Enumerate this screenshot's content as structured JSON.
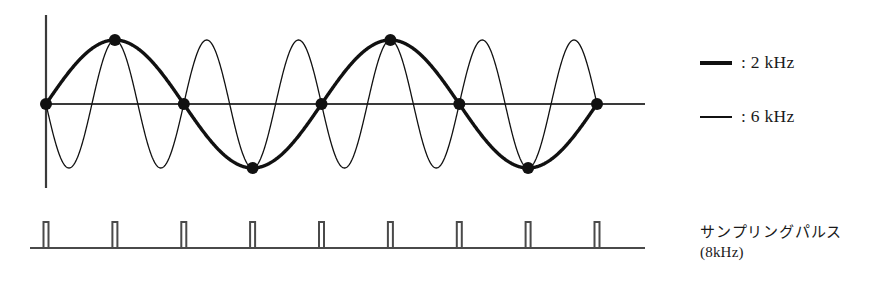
{
  "figure": {
    "title_hidden": "",
    "background_color": "#ffffff",
    "ink_color": "#111111"
  },
  "legend": {
    "position": "right",
    "entries": [
      {
        "swatch": "thick-line-swatch",
        "style": "thick",
        "label": ": 2 kHz",
        "frequency_khz": 2
      },
      {
        "swatch": "thin-line-swatch",
        "style": "thin",
        "label": ": 6 kHz",
        "frequency_khz": 6
      }
    ]
  },
  "caption": {
    "line1": "サンプリングパルス",
    "line2": "(8kHz)"
  },
  "chart_data": {
    "type": "line",
    "title": "",
    "xlabel": "",
    "ylabel": "",
    "grid": false,
    "legend_position": "right",
    "axes": {
      "x_axis_y_px": 104,
      "x_axis_from_px": 46,
      "x_axis_to_px": 645,
      "y_axis_x_px": 46,
      "y_axis_from_px": 15,
      "y_axis_to_px": 188,
      "amplitude_px": 64,
      "x_range_periods": 4,
      "xlim": [
        0,
        4
      ],
      "ylim": [
        -1,
        1
      ]
    },
    "series": [
      {
        "name": "2 kHz",
        "style": "thick",
        "stroke_width": 3.4,
        "color": "#111111",
        "waveform": "sin",
        "cycles_across_plot": 2,
        "phase_deg": 0,
        "amplitude": 1,
        "description": "Thick 2 kHz sine: two full cycles across the plot"
      },
      {
        "name": "6 kHz",
        "style": "thin",
        "stroke_width": 1.3,
        "color": "#111111",
        "waveform": "-sin",
        "cycles_across_plot": 6,
        "phase_deg": 180,
        "amplitude": 1,
        "description": "Thin 6 kHz sine (inverted), six full cycles; aliases onto the 2 kHz samples"
      }
    ],
    "sample_points": {
      "name": "sample dots",
      "count": 9,
      "rate_khz": 8,
      "marker": "filled-circle",
      "radius_px": 6,
      "x_px": [
        46,
        114.9,
        183.8,
        252.6,
        321.5,
        390.4,
        459.3,
        528.1,
        597
      ],
      "values": [
        0,
        1,
        0,
        -1,
        0,
        1,
        0,
        -1,
        0
      ]
    },
    "pulse_train": {
      "name": "sampling pulses",
      "rate_khz": 8,
      "count": 9,
      "baseline_y_px": 248,
      "top_y_px": 222,
      "baseline_from_px": 30,
      "baseline_to_px": 645,
      "width_px": 5,
      "x_px": [
        46,
        114.9,
        183.8,
        252.6,
        321.5,
        390.4,
        459.3,
        528.1,
        597
      ]
    }
  }
}
